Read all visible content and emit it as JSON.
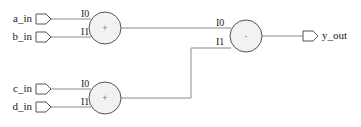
{
  "schematic": {
    "inputs": [
      {
        "name": "a_in"
      },
      {
        "name": "b_in"
      },
      {
        "name": "c_in"
      },
      {
        "name": "d_in"
      }
    ],
    "outputs": [
      {
        "name": "y_out"
      }
    ],
    "operators": [
      {
        "id": "add_top",
        "symbol": "+",
        "pins": [
          "I0",
          "I1"
        ]
      },
      {
        "id": "add_bottom",
        "symbol": "+",
        "pins": [
          "I0",
          "I1"
        ]
      },
      {
        "id": "sub",
        "symbol": "-",
        "pins": [
          "I0",
          "I1"
        ]
      }
    ]
  }
}
